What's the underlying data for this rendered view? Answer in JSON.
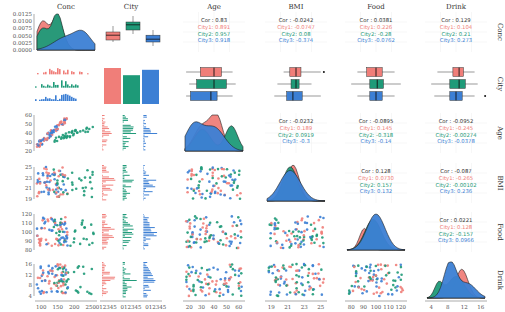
{
  "colors": {
    "city1": "#F07E79",
    "city2": "#1E9A78",
    "city3": "#3C7FD4",
    "text": "#333333",
    "grid": "#EBEBEB"
  },
  "variables": [
    "Conc",
    "City",
    "Age",
    "BMI",
    "Food",
    "Drink"
  ],
  "chart_data": {
    "type": "pairs-matrix",
    "title": "",
    "groups": [
      "City1",
      "City2",
      "City3"
    ],
    "column_labels": [
      "Conc",
      "City",
      "Age",
      "BMI",
      "Food",
      "Drink"
    ],
    "row_labels": [
      "Conc",
      "City",
      "Age",
      "BMI",
      "Food",
      "Drink"
    ],
    "axis_ticks": {
      "Conc_density_y": [
        "0.0000",
        "0.0025",
        "0.0050",
        "0.0075",
        "0.0100",
        "0.0125"
      ],
      "Conc_x": [
        "100",
        "150",
        "200",
        "250"
      ],
      "City_x": [
        "0",
        "1",
        "2",
        "3",
        "4",
        "5",
        "0",
        "1",
        "2",
        "3",
        "4",
        "5",
        "0",
        "1",
        "2",
        "3",
        "4",
        "5"
      ],
      "Age": [
        "20",
        "30",
        "40",
        "50",
        "60"
      ],
      "BMI": [
        "19",
        "21",
        "23",
        "25"
      ],
      "Food": [
        "80",
        "90",
        "100",
        "110",
        "120"
      ],
      "Drink": [
        "4",
        "8",
        "12",
        "16"
      ]
    },
    "correlations": [
      {
        "pair": [
          "Conc",
          "Age"
        ],
        "Cor": "0.83",
        "City1": "0.891",
        "City2": "0.957",
        "City3": "0.918"
      },
      {
        "pair": [
          "Conc",
          "BMI"
        ],
        "Cor": "-0.0242",
        "City1": "-0.0747",
        "City2": "0.08",
        "City3": "-0.374"
      },
      {
        "pair": [
          "Conc",
          "Food"
        ],
        "Cor": "0.0381",
        "City1": "0.226",
        "City2": "-0.28",
        "City3": "-0.0762"
      },
      {
        "pair": [
          "Conc",
          "Drink"
        ],
        "Cor": "0.129",
        "City1": "0.104",
        "City2": "0.21",
        "City3": "0.273"
      },
      {
        "pair": [
          "Age",
          "BMI"
        ],
        "Cor": "-0.0232",
        "City1": "0.189",
        "City2": "0.0919",
        "City3": "-0.3"
      },
      {
        "pair": [
          "Age",
          "Food"
        ],
        "Cor": "-0.0895",
        "City1": "0.145",
        "City2": "-0.318",
        "City3": "-0.14"
      },
      {
        "pair": [
          "Age",
          "Drink"
        ],
        "Cor": "-0.0952",
        "City1": "-0.245",
        "City2": "-0.00274",
        "City3": "-0.0378"
      },
      {
        "pair": [
          "BMI",
          "Food"
        ],
        "Cor": "0.128",
        "City1": "0.0730",
        "City2": "0.157",
        "City3": "0.132"
      },
      {
        "pair": [
          "BMI",
          "Drink"
        ],
        "Cor": "-0.087",
        "City1": "-0.265",
        "City2": "-0.00102",
        "City3": "0.236"
      },
      {
        "pair": [
          "Food",
          "Drink"
        ],
        "Cor": "0.0221",
        "City1": "0.128",
        "City2": "-0.157",
        "City3": "0.0966"
      }
    ],
    "city_counts": {
      "City1": 40,
      "City2": 32,
      "City3": 38
    }
  }
}
